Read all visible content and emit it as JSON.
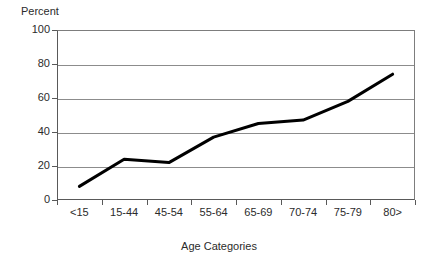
{
  "chart_data": {
    "type": "line",
    "title": "",
    "xlabel": "Age Categories",
    "ylabel": "Percent",
    "categories": [
      "<15",
      "15-44",
      "45-54",
      "55-64",
      "65-69",
      "70-74",
      "75-79",
      "80>"
    ],
    "values": [
      8,
      24,
      22,
      37,
      45,
      47,
      58,
      74
    ],
    "series": [
      {
        "name": "Percent",
        "values": [
          8,
          24,
          22,
          37,
          45,
          47,
          58,
          74
        ],
        "color": "#000000"
      }
    ],
    "ylim": [
      0,
      100
    ],
    "yticks": [
      0,
      20,
      40,
      60,
      80,
      100
    ],
    "ytick_labels": [
      "0",
      "20",
      "40",
      "60",
      "80",
      "100"
    ],
    "grid": true,
    "grid_axis": "y",
    "legend": "none",
    "line_width": 3,
    "markers": false
  },
  "axes": {
    "y_title": "Percent",
    "x_title": "Age Categories"
  },
  "colors": {
    "line": "#000000",
    "grid": "#8c8c8c",
    "axis": "#595959",
    "text": "#2b2b2b",
    "background": "#ffffff"
  }
}
